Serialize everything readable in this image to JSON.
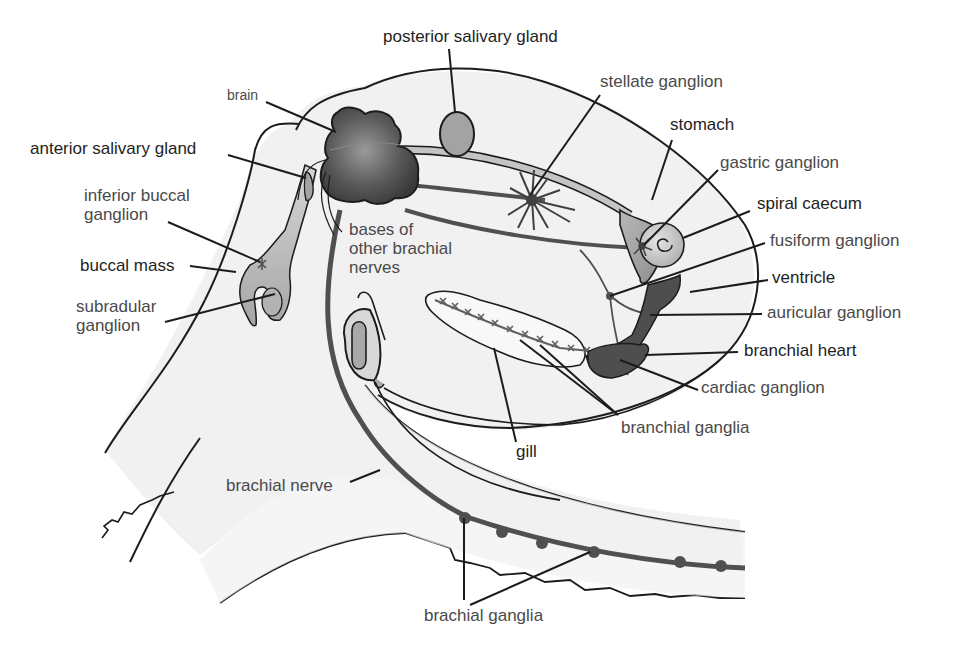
{
  "diagram": {
    "colors": {
      "body_fill": "#f1f1f1",
      "outline": "#1c1c1c",
      "nerve": "#505050",
      "brain_dark": "#3c3c3c",
      "brain_light": "#8f8f8f",
      "gland": "#a3a3a3",
      "heart": "#4e4e4e",
      "stomach": "#a8a8a8",
      "caecum": "#cfcfcf"
    },
    "labels": {
      "posterior_salivary_gland": "posterior salivary gland",
      "brain": "brain",
      "stellate_ganglion": "stellate ganglion",
      "anterior_salivary_gland": "anterior salivary gland",
      "stomach": "stomach",
      "gastric_ganglion": "gastric ganglion",
      "inferior_buccal_ganglion": "inferior buccal\nganglion",
      "spiral_caecum": "spiral caecum",
      "bases_of_other_brachial_nerves": "bases of\nother brachial\nnerves",
      "fusiform_ganglion": "fusiform ganglion",
      "buccal_mass": "buccal mass",
      "ventricle": "ventricle",
      "subradular_ganglion": "subradular\nganglion",
      "auricular_ganglion": "auricular ganglion",
      "branchial_heart": "branchial heart",
      "cardiac_ganglion": "cardiac ganglion",
      "branchial_ganglia": "branchial ganglia",
      "gill": "gill",
      "brachial_nerve": "brachial nerve",
      "brachial_ganglia": "brachial ganglia"
    }
  }
}
